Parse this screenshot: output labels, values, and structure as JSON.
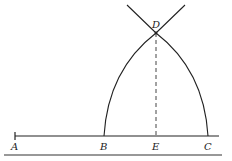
{
  "diagram": {
    "type": "geometric-construction",
    "points": {
      "A": {
        "label": "A",
        "x": 15,
        "y": 136
      },
      "B": {
        "label": "B",
        "x": 104,
        "y": 136
      },
      "E": {
        "label": "E",
        "x": 156,
        "y": 136
      },
      "C": {
        "label": "C",
        "x": 208,
        "y": 136
      },
      "D": {
        "label": "D",
        "x": 156,
        "y": 33
      }
    },
    "colors": {
      "stroke": "#222222",
      "background": "#ffffff"
    }
  }
}
